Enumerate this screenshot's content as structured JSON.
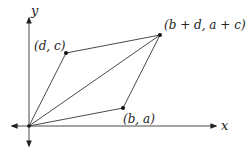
{
  "diagram": {
    "type": "parallelogram-vectors",
    "colors": {
      "line": "#4a4a4a",
      "axis": "#4a4a4a",
      "point": "#111111",
      "text": "#222222"
    },
    "axes": {
      "x_label": "x",
      "y_label": "y"
    },
    "points": [
      {
        "id": "origin",
        "label": ""
      },
      {
        "id": "d_c",
        "label": "(d, c)"
      },
      {
        "id": "b_a",
        "label": "(b, a)"
      },
      {
        "id": "sum",
        "label": "(b + d, a + c)"
      }
    ],
    "edges": [
      {
        "from": "origin",
        "to": "d_c"
      },
      {
        "from": "origin",
        "to": "b_a"
      },
      {
        "from": "origin",
        "to": "sum"
      },
      {
        "from": "d_c",
        "to": "sum"
      },
      {
        "from": "b_a",
        "to": "sum"
      }
    ]
  }
}
